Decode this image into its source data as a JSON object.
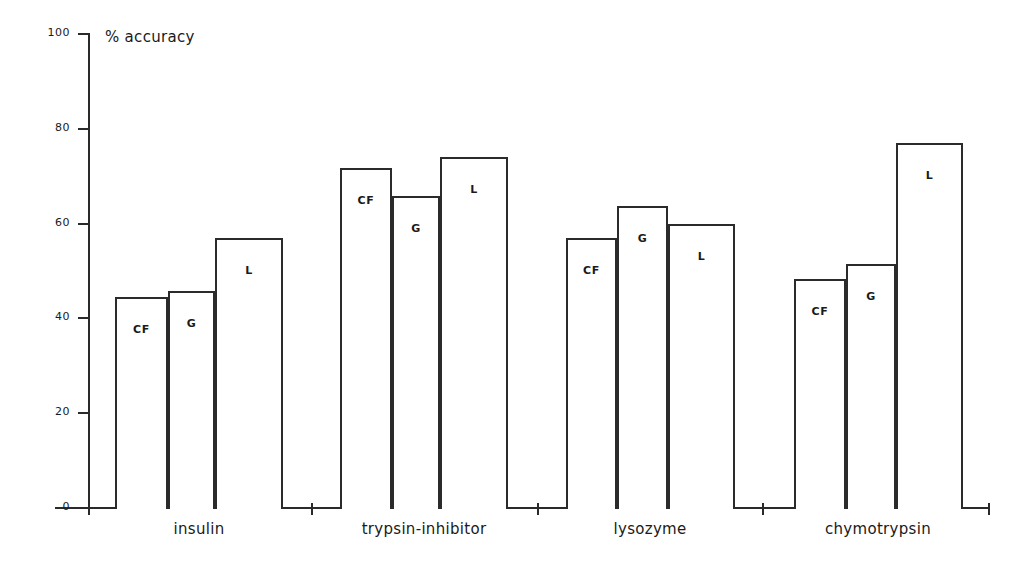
{
  "chart_data": {
    "type": "bar",
    "title": "",
    "xlabel": "",
    "ylabel": "% accuracy",
    "ylim": [
      0,
      100
    ],
    "yticks": [
      0,
      20,
      40,
      60,
      80,
      100
    ],
    "grid": false,
    "legend": "in-bar labels",
    "categories": [
      "insulin",
      "trypsin-inhibitor",
      "lysozyme",
      "chymotrypsin"
    ],
    "series": [
      {
        "name": "CF",
        "values": [
          44.4,
          71.6,
          56.8,
          48.0
        ]
      },
      {
        "name": "G",
        "values": [
          45.5,
          65.7,
          63.6,
          51.2
        ]
      },
      {
        "name": "L",
        "values": [
          56.8,
          73.9,
          59.6,
          76.8
        ]
      }
    ],
    "bars": [
      {
        "group": "insulin",
        "series": "CF",
        "value": 44.4,
        "x": 115,
        "width": 53
      },
      {
        "group": "insulin",
        "series": "G",
        "value": 45.5,
        "x": 168,
        "width": 47
      },
      {
        "group": "insulin",
        "series": "L",
        "value": 56.8,
        "x": 215,
        "width": 68
      },
      {
        "group": "trypsin-inhibitor",
        "series": "CF",
        "value": 71.6,
        "x": 340,
        "width": 52
      },
      {
        "group": "trypsin-inhibitor",
        "series": "G",
        "value": 65.7,
        "x": 392,
        "width": 48
      },
      {
        "group": "trypsin-inhibitor",
        "series": "L",
        "value": 73.9,
        "x": 440,
        "width": 68
      },
      {
        "group": "lysozyme",
        "series": "CF",
        "value": 56.8,
        "x": 566,
        "width": 51
      },
      {
        "group": "lysozyme",
        "series": "G",
        "value": 63.6,
        "x": 617,
        "width": 51
      },
      {
        "group": "lysozyme",
        "series": "L",
        "value": 59.6,
        "x": 668,
        "width": 67
      },
      {
        "group": "chymotrypsin",
        "series": "CF",
        "value": 48.0,
        "x": 794,
        "width": 52
      },
      {
        "group": "chymotrypsin",
        "series": "G",
        "value": 51.2,
        "x": 846,
        "width": 50
      },
      {
        "group": "chymotrypsin",
        "series": "L",
        "value": 76.8,
        "x": 896,
        "width": 67
      }
    ],
    "colors": {
      "axis": "#2a2a2a",
      "bar_outline": "#2b2b2b",
      "bar_fill": "#ffffff",
      "text": "#1a1a1a",
      "background": "#ffffff"
    }
  },
  "axis": {
    "y_title": "% accuracy",
    "y_ticks": [
      "0",
      "20",
      "40",
      "60",
      "80",
      "100"
    ]
  },
  "groups": [
    {
      "label": "insulin",
      "center": 199
    },
    {
      "label": "trypsin-inhibitor",
      "center": 424
    },
    {
      "label": "lysozyme",
      "center": 650
    },
    {
      "label": "chymotrypsin",
      "center": 878
    }
  ],
  "bar_series_labels": [
    "CF",
    "G",
    "L"
  ]
}
